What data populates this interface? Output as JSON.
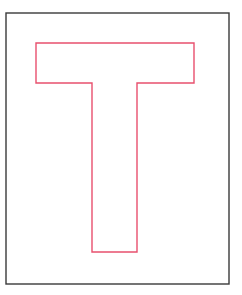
{
  "figure": {
    "letter": "T",
    "frame": {
      "x1": 6,
      "y1": 13,
      "x2": 229,
      "y2": 284,
      "stroke": "#3a3a3a",
      "stroke_width": 1.4
    },
    "shape": {
      "stroke": "#e8506e",
      "stroke_width": 1.4,
      "points": "36,43 194,43 194,83 137,83 137,252 92,252 92,83 36,83"
    },
    "background": "#ffffff"
  }
}
